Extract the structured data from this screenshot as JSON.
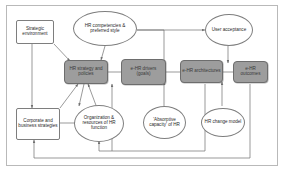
{
  "diagram": {
    "frame_color": "#b9b9b9",
    "accent_color": "#9d9d9d",
    "line_color": "#6f6f6f",
    "nodes": [
      {
        "id": "strategic-environment",
        "label": "Strategic environment",
        "shape": "rect"
      },
      {
        "id": "hr-competencies",
        "label": "HR competencies & preferred style",
        "shape": "ellipse"
      },
      {
        "id": "user-acceptance",
        "label": "User acceptance",
        "shape": "ellipse"
      },
      {
        "id": "hr-strategy-policies",
        "label": "HR strategy and policies",
        "shape": "gray-box"
      },
      {
        "id": "ehr-drivers",
        "label": "e-HR drivers (goals)",
        "shape": "gray-box"
      },
      {
        "id": "ehr-architectures",
        "label": "e-HR architectures",
        "shape": "gray-box"
      },
      {
        "id": "ehr-outcomes",
        "label": "e-HR outcomes",
        "shape": "gray-box"
      },
      {
        "id": "corporate-business-strategies",
        "label": "Corporate and business strategies",
        "shape": "rect"
      },
      {
        "id": "organization-resources",
        "label": "Organization & resources of HR function",
        "shape": "ellipse"
      },
      {
        "id": "absorptive-capacity",
        "label": "'Absorptive capacity' of HR",
        "shape": "ellipse"
      },
      {
        "id": "hr-change-model",
        "label": "HR change model",
        "shape": "ellipse"
      }
    ]
  }
}
